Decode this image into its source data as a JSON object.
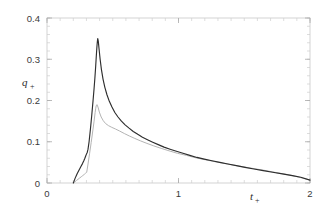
{
  "figure": {
    "background_color": "#ffffff",
    "frame_color": "#c9c9c9"
  },
  "chart_data": {
    "type": "line",
    "title": "",
    "subtitle": "",
    "xlabel": "t+",
    "xlabel_base": "t",
    "xlabel_sub": "+",
    "ylabel": "q+",
    "ylabel_base": "q",
    "ylabel_sub": "+",
    "xlim": [
      0,
      2
    ],
    "ylim": [
      0,
      0.4
    ],
    "xticks": [
      0,
      1,
      2
    ],
    "xticklabels": [
      "0",
      "1",
      "2"
    ],
    "yticks": [
      0,
      0.1,
      0.2,
      0.3,
      0.4
    ],
    "yticklabels": [
      "0",
      "0.1",
      "0.2",
      "0.3",
      "0.4"
    ],
    "x_minor_step": 0.1,
    "y_minor_step": 0.02,
    "grid": false,
    "legend": null,
    "legend_position": "none",
    "annotations": [],
    "series": [
      {
        "name": "primary-curve",
        "color": "#2e2e2e",
        "linewidth": 1.15,
        "style": "solid",
        "x": [
          0.2,
          0.205,
          0.212,
          0.22,
          0.23,
          0.24,
          0.25,
          0.26,
          0.27,
          0.28,
          0.288,
          0.295,
          0.3,
          0.303,
          0.306,
          0.312,
          0.32,
          0.33,
          0.34,
          0.35,
          0.358,
          0.364,
          0.37,
          0.374,
          0.377,
          0.38,
          0.383,
          0.386,
          0.39,
          0.396,
          0.404,
          0.414,
          0.426,
          0.44,
          0.456,
          0.474,
          0.494,
          0.516,
          0.54,
          0.566,
          0.594,
          0.624,
          0.656,
          0.69,
          0.726,
          0.764,
          0.804,
          0.846,
          0.89,
          0.936,
          0.984,
          1.034,
          1.086,
          1.14,
          1.196,
          1.254,
          1.314,
          1.376,
          1.44,
          1.506,
          1.574,
          1.644,
          1.716,
          1.79,
          1.866,
          1.93,
          2.0
        ],
        "y": [
          0.0,
          0.004,
          0.01,
          0.016,
          0.023,
          0.029,
          0.035,
          0.041,
          0.047,
          0.054,
          0.06,
          0.066,
          0.07,
          0.072,
          0.074,
          0.082,
          0.1,
          0.13,
          0.163,
          0.199,
          0.229,
          0.254,
          0.282,
          0.303,
          0.318,
          0.332,
          0.343,
          0.35,
          0.344,
          0.325,
          0.3,
          0.275,
          0.252,
          0.232,
          0.214,
          0.198,
          0.184,
          0.171,
          0.16,
          0.15,
          0.141,
          0.133,
          0.125,
          0.118,
          0.111,
          0.105,
          0.099,
          0.093,
          0.087,
          0.082,
          0.077,
          0.072,
          0.067,
          0.062,
          0.058,
          0.054,
          0.05,
          0.046,
          0.042,
          0.038,
          0.034,
          0.03,
          0.026,
          0.022,
          0.018,
          0.014,
          0.007
        ]
      },
      {
        "name": "secondary-curve",
        "color": "#b4b4b4",
        "linewidth": 1.0,
        "style": "solid",
        "x": [
          0.202,
          0.212,
          0.224,
          0.236,
          0.248,
          0.26,
          0.272,
          0.284,
          0.294,
          0.302,
          0.312,
          0.324,
          0.336,
          0.348,
          0.358,
          0.366,
          0.37,
          0.374,
          0.38,
          0.388,
          0.398,
          0.412,
          0.428,
          0.446,
          0.468,
          0.492,
          0.52,
          0.552,
          0.588,
          0.626,
          0.668,
          0.712,
          0.76,
          0.812,
          0.868,
          0.928,
          0.992,
          1.06,
          1.132,
          1.208,
          1.288,
          1.372,
          1.46,
          1.552,
          1.648,
          1.748,
          1.852,
          1.93,
          2.0
        ],
        "y": [
          0.0,
          0.003,
          0.006,
          0.009,
          0.012,
          0.015,
          0.018,
          0.021,
          0.024,
          0.026,
          0.046,
          0.072,
          0.098,
          0.126,
          0.15,
          0.171,
          0.18,
          0.187,
          0.19,
          0.184,
          0.172,
          0.16,
          0.151,
          0.144,
          0.139,
          0.135,
          0.131,
          0.126,
          0.12,
          0.114,
          0.108,
          0.102,
          0.096,
          0.09,
          0.084,
          0.078,
          0.072,
          0.067,
          0.061,
          0.056,
          0.051,
          0.046,
          0.041,
          0.036,
          0.031,
          0.025,
          0.019,
          0.013,
          0.007
        ]
      }
    ]
  }
}
